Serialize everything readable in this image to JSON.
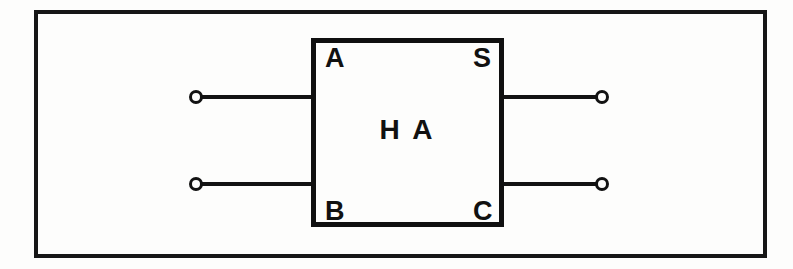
{
  "diagram": {
    "kind": "block-diagram",
    "block": {
      "title": "H A",
      "pins": {
        "input_top": "A",
        "input_bottom": "B",
        "output_top": "S",
        "output_bottom": "C"
      }
    },
    "terminals": [
      {
        "id": "terminal-a",
        "side": "left",
        "pin": "A",
        "shape": "open-circle"
      },
      {
        "id": "terminal-b",
        "side": "left",
        "pin": "B",
        "shape": "open-circle"
      },
      {
        "id": "terminal-s",
        "side": "right",
        "pin": "S",
        "shape": "open-circle"
      },
      {
        "id": "terminal-c",
        "side": "right",
        "pin": "C",
        "shape": "open-circle"
      }
    ],
    "wires": [
      {
        "id": "wire-a",
        "from": "terminal-a",
        "to": "block-pin-A"
      },
      {
        "id": "wire-b",
        "from": "terminal-b",
        "to": "block-pin-B"
      },
      {
        "id": "wire-s",
        "from": "block-pin-S",
        "to": "terminal-s"
      },
      {
        "id": "wire-c",
        "from": "block-pin-C",
        "to": "terminal-c"
      }
    ],
    "colors": {
      "ink": "#131313",
      "paper": "#fdfdfc"
    }
  }
}
